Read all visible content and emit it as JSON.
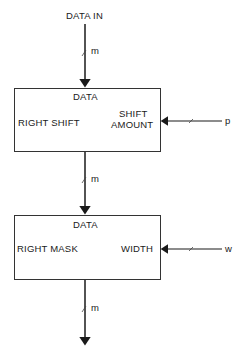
{
  "diagram": {
    "input_label": "DATA IN",
    "blocks": [
      {
        "top_label": "DATA",
        "left_label": "RIGHT SHIFT",
        "right_label_line1": "SHIFT",
        "right_label_line2": "AMOUNT",
        "side_input": "p"
      },
      {
        "top_label": "DATA",
        "left_label": "RIGHT MASK",
        "right_label_line1": "WIDTH",
        "side_input": "w"
      }
    ],
    "bus_widths": [
      "m",
      "m",
      "m"
    ]
  }
}
